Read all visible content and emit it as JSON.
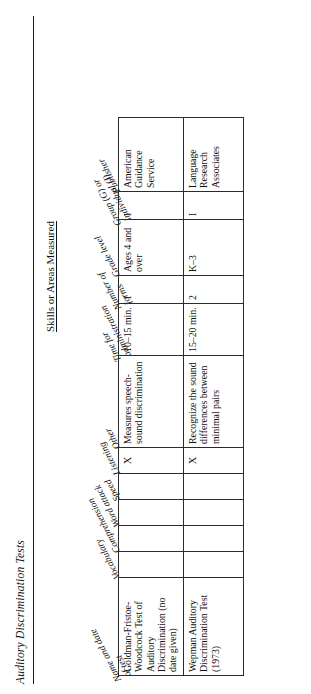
{
  "document": {
    "title": "Auditory Discrimination Tests",
    "group_heading": "Skills or Areas Measured"
  },
  "table": {
    "slanted_headers": [
      {
        "label_line1": "Name and date",
        "label_line2": "of test"
      },
      {
        "label_line1": "Vocabulary",
        "label_line2": ""
      },
      {
        "label_line1": "Comprehension",
        "label_line2": ""
      },
      {
        "label_line1": "Word attack",
        "label_line2": ""
      },
      {
        "label_line1": "Speed",
        "label_line2": ""
      },
      {
        "label_line1": "Listening",
        "label_line2": ""
      },
      {
        "label_line1": "Other",
        "label_line2": ""
      },
      {
        "label_line1": "Time for",
        "label_line2": "administration"
      },
      {
        "label_line1": "Number of",
        "label_line2": "forms"
      },
      {
        "label_line1": "Grade level",
        "label_line2": ""
      },
      {
        "label_line1": "Group (G) or",
        "label_line2": "individual (I)"
      },
      {
        "label_line1": "Publisher",
        "label_line2": ""
      }
    ],
    "columns": [
      "Name and date of test",
      "Vocabulary",
      "Comprehension",
      "Word attack",
      "Speed",
      "Listening",
      "Other",
      "Time for administration",
      "Number of forms",
      "Grade level",
      "Group (G) or individual (I)",
      "Publisher"
    ],
    "rows": [
      {
        "name": "Goldman-Fristoe-Woodcock Test of Auditory Discrimination (no date given)",
        "vocabulary": "",
        "comprehension": "",
        "word_attack": "",
        "speed": "",
        "listening": "X",
        "other": "Measures speech-sound discrimination",
        "time": "10–15 min.",
        "forms": "1",
        "grade_level": "Ages 4 and over",
        "group_or_individual": "I",
        "publisher": "American Guidance Service"
      },
      {
        "name": "Wepman Auditory Discrimination Test (1973)",
        "vocabulary": "",
        "comprehension": "",
        "word_attack": "",
        "speed": "",
        "listening": "X",
        "other": "Recognize the sound differences between minimal pairs",
        "time": "15–20 min.",
        "forms": "2",
        "grade_level": "K–3",
        "group_or_individual": "I",
        "publisher": "Language Research Associates"
      }
    ]
  },
  "colors": {
    "page_background": "#ffffff",
    "text": "#111111",
    "rule": "#1a1a1a",
    "grid_line": "#2b2b2b"
  }
}
